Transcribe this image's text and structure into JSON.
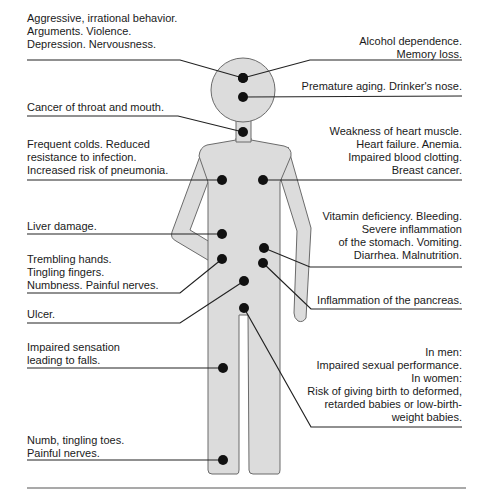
{
  "figure": {
    "body_fill": "#dcdcdc",
    "body_stroke": "#6b6b6b",
    "line_color": "#222222",
    "dot_color": "#111111"
  },
  "annotations": [
    {
      "id": "brain-behavior",
      "side": "left",
      "organ": "head-left",
      "lines": [
        "Aggressive, irrational behavior.",
        "Arguments. Violence.",
        "Depression. Nervousness."
      ]
    },
    {
      "id": "alcohol-dependence",
      "side": "right",
      "organ": "head-right",
      "lines": [
        "Alcohol dependence.",
        "Memory loss."
      ]
    },
    {
      "id": "premature-aging",
      "side": "right",
      "organ": "face",
      "lines": [
        "Premature aging. Drinker's nose."
      ]
    },
    {
      "id": "throat-cancer",
      "side": "left",
      "organ": "throat",
      "lines": [
        "Cancer of throat and mouth."
      ]
    },
    {
      "id": "lungs",
      "side": "left",
      "organ": "lungs",
      "lines": [
        "Frequent colds. Reduced",
        "resistance to infection.",
        "Increased risk of pneumonia."
      ]
    },
    {
      "id": "heart",
      "side": "right",
      "organ": "heart",
      "lines": [
        "Weakness of heart muscle.",
        "Heart failure. Anemia.",
        "Impaired blood clotting.",
        "Breast cancer."
      ]
    },
    {
      "id": "liver",
      "side": "left",
      "organ": "liver",
      "lines": [
        "Liver damage."
      ]
    },
    {
      "id": "stomach",
      "side": "right",
      "organ": "stomach",
      "lines": [
        "Vitamin deficiency. Bleeding.",
        "Severe inflammation",
        "of the stomach. Vomiting.",
        "Diarrhea. Malnutrition."
      ]
    },
    {
      "id": "hands",
      "side": "left",
      "organ": "hand",
      "lines": [
        "Trembling hands.",
        "Tingling fingers.",
        "Numbness. Painful nerves."
      ]
    },
    {
      "id": "pancreas",
      "side": "right",
      "organ": "pancreas",
      "lines": [
        "Inflammation of the pancreas."
      ]
    },
    {
      "id": "ulcer",
      "side": "left",
      "organ": "intestine",
      "lines": [
        "Ulcer."
      ]
    },
    {
      "id": "legs",
      "side": "left",
      "organ": "thigh",
      "lines": [
        "Impaired sensation",
        "leading to falls."
      ]
    },
    {
      "id": "reproductive",
      "side": "right",
      "organ": "groin",
      "lines": [
        "In men:",
        "Impaired sexual performance.",
        "In women:",
        "Risk of giving birth to deformed,",
        "retarded babies or low-birth-",
        "weight babies."
      ]
    },
    {
      "id": "feet",
      "side": "left",
      "organ": "foot",
      "lines": [
        "Numb, tingling toes.",
        "Painful nerves."
      ]
    }
  ]
}
